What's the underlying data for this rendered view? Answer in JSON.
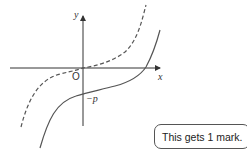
{
  "diagram": {
    "axes": {
      "x_label": "x",
      "y_label": "y",
      "origin_label": "O",
      "intercept_label": "−p"
    },
    "curves": [
      {
        "name": "original-curve",
        "style": "dashed",
        "description": "cubic through origin"
      },
      {
        "name": "translated-curve",
        "style": "solid",
        "description": "same cubic shifted down by p"
      }
    ],
    "colors": {
      "axis": "#333333",
      "curve": "#555555"
    }
  },
  "callout": {
    "text": "This gets 1 mark."
  }
}
